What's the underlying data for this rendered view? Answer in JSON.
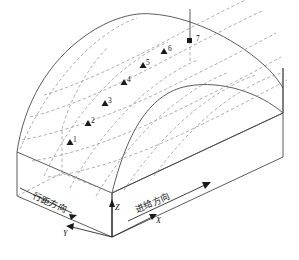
{
  "figure": {
    "kind": "3d-isometric-diagram",
    "background_color": "#ffffff",
    "solid_edge_color": "#4a4a4a",
    "dashed_grid_color": "#8d8d8d",
    "axis_color": "#2b2b2b",
    "point_color": "#1a1a1a"
  },
  "axes": {
    "x": {
      "label": "X",
      "arrow": "up-right",
      "tip": [
        155,
        215
      ],
      "tail": [
        112,
        237
      ]
    },
    "y": {
      "label": "Y",
      "arrow": "down-left",
      "tip": [
        66,
        228
      ],
      "tail": [
        112,
        237
      ]
    },
    "z": {
      "label": "Z",
      "arrow": "up",
      "tip": [
        112,
        200
      ],
      "tail": [
        112,
        237
      ]
    }
  },
  "direction_labels": [
    {
      "id": "row-spacing",
      "text": "行距方向",
      "arrow": "down-left"
    },
    {
      "id": "feed",
      "text": "进给方向",
      "arrow": "up-right"
    }
  ],
  "measurement_points": [
    {
      "label": "1",
      "x": 70,
      "y": 142
    },
    {
      "label": "2",
      "x": 88,
      "y": 123
    },
    {
      "label": "3",
      "x": 105,
      "y": 103
    },
    {
      "label": "4",
      "x": 124,
      "y": 82
    },
    {
      "label": "5",
      "x": 143,
      "y": 65
    },
    {
      "label": "6",
      "x": 164,
      "y": 51
    },
    {
      "label": "7",
      "x": 190,
      "y": 41
    }
  ],
  "geometry_notes": {
    "point_count": 7,
    "grid_rows": 5,
    "grid_cols": 5,
    "has_vertical_drop_line_at_point": "7"
  }
}
